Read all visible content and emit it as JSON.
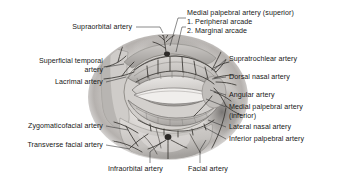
{
  "figure": {
    "type": "anatomical-illustration",
    "style": "grayscale medical illustration, pencil and wash rendering"
  },
  "colors": {
    "background": "#ffffff",
    "text": "#171717",
    "leader_line": "#2b2b2b",
    "illustration_light": "#e6e4e2",
    "illustration_mid": "#b9b6b3",
    "illustration_dark": "#6e6b69",
    "vessel": "#3d3a38"
  },
  "labels": {
    "top": [
      {
        "id": "supraorbital-artery",
        "text": "Supraorbital artery",
        "align": "right",
        "x": 28,
        "y": 30,
        "width": 104
      }
    ],
    "top_right_block": {
      "id": "medial-palpebral-artery-superior",
      "lines": [
        "Medial palpebral artery (superior)",
        "1. Peripheral arcade",
        "2. Marginal arcade"
      ],
      "align": "left",
      "x": 187,
      "y": 9,
      "width": 146
    },
    "left": [
      {
        "id": "superficial-temporal-artery",
        "lines": [
          "Superficial temporal",
          "artery"
        ],
        "align": "right",
        "x": 8,
        "y": 57,
        "width": 95
      },
      {
        "id": "lacrimal-artery",
        "text": "Lacrimal artery",
        "align": "right",
        "x": 28,
        "y": 79,
        "width": 75
      },
      {
        "id": "zygomaticofacial-artery",
        "text": "Zygomaticofacial artery",
        "align": "right",
        "x": 5,
        "y": 123,
        "width": 98
      },
      {
        "id": "transverse-facial-artery",
        "text": "Transverse facial artery",
        "align": "right",
        "x": 5,
        "y": 142,
        "width": 98
      }
    ],
    "right": [
      {
        "id": "supratrochlear-artery",
        "text": "Supratrochlear artery",
        "align": "left",
        "x": 228,
        "y": 56,
        "width": 106
      },
      {
        "id": "dorsal-nasal-artery",
        "text": "Dorsal nasal artery",
        "align": "left",
        "x": 228,
        "y": 74,
        "width": 106
      },
      {
        "id": "angular-artery",
        "text": "Angular artery",
        "align": "left",
        "x": 228,
        "y": 92,
        "width": 106
      },
      {
        "id": "medial-palpebral-artery-inferior",
        "lines": [
          "Medial palpebral artery",
          "(inferior)"
        ],
        "align": "left",
        "x": 228,
        "y": 104,
        "width": 108
      },
      {
        "id": "lateral-nasal-artery",
        "text": "Lateral nasal artery",
        "align": "left",
        "x": 228,
        "y": 124,
        "width": 106
      },
      {
        "id": "inferior-palpebral-artery",
        "text": "Inferior palpebral artery",
        "align": "left",
        "x": 228,
        "y": 136,
        "width": 108
      }
    ],
    "bottom": [
      {
        "id": "infraorbital-artery",
        "text": "Infraorbital artery",
        "align": "left",
        "x": 108,
        "y": 166,
        "width": 80
      },
      {
        "id": "facial-artery",
        "text": "Facial artery",
        "align": "left",
        "x": 188,
        "y": 166,
        "width": 64
      }
    ]
  },
  "arteries_depicted": [
    "Supraorbital artery",
    "Medial palpebral artery (superior)",
    "Peripheral arcade",
    "Marginal arcade",
    "Supratrochlear artery",
    "Dorsal nasal artery",
    "Angular artery",
    "Medial palpebral artery (inferior)",
    "Lateral nasal artery",
    "Inferior palpebral artery",
    "Superficial temporal artery",
    "Lacrimal artery",
    "Zygomaticofacial artery",
    "Transverse facial artery",
    "Infraorbital artery",
    "Facial artery"
  ]
}
